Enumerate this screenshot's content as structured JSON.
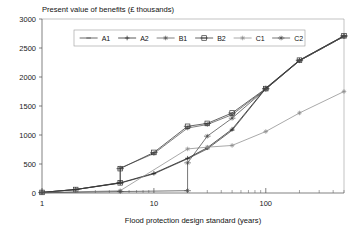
{
  "chart_data": {
    "type": "line",
    "title": "Present value of benefits (£ thousands)",
    "subtitle": "",
    "xlabel": "Flood protection design standard (years)",
    "ylabel": "Present value of benefits (£ thousands)",
    "xscale": "log",
    "xlim": [
      1,
      500
    ],
    "ylim": [
      0,
      3000
    ],
    "xticks": [
      1,
      10,
      100
    ],
    "xtick_labels": [
      "1",
      "10",
      "100"
    ],
    "yticks": [
      0,
      500,
      1000,
      1500,
      2000,
      2500,
      3000
    ],
    "ytick_labels": [
      "0",
      "500",
      "1000",
      "1500",
      "2000",
      "2500",
      "3000"
    ],
    "grid": false,
    "legend_position": "top-center",
    "series": [
      {
        "name": "A1",
        "color": "#3a3a3a",
        "marker": "dash",
        "x": [
          1,
          2,
          5,
          10,
          20,
          30,
          50,
          100,
          200,
          500
        ],
        "y": [
          10,
          60,
          170,
          330,
          590,
          760,
          1080,
          1800,
          2280,
          2700
        ]
      },
      {
        "name": "A2",
        "color": "#222222",
        "marker": "plus",
        "x": [
          1,
          2,
          5,
          10,
          20,
          30,
          50,
          100,
          200,
          500
        ],
        "y": [
          10,
          60,
          175,
          340,
          600,
          780,
          1100,
          1810,
          2290,
          2710
        ]
      },
      {
        "name": "B1",
        "color": "#555555",
        "marker": "asterisk",
        "x": [
          1,
          2,
          5,
          5,
          10,
          20,
          30,
          50,
          100,
          200,
          500
        ],
        "y": [
          10,
          60,
          180,
          430,
          680,
          1120,
          1180,
          1350,
          1790,
          2280,
          2700
        ]
      },
      {
        "name": "B2",
        "color": "#333333",
        "marker": "boxplus",
        "x": [
          1,
          2,
          5,
          5,
          10,
          20,
          30,
          50,
          100,
          200,
          500
        ],
        "y": [
          10,
          60,
          175,
          420,
          700,
          1150,
          1200,
          1380,
          1800,
          2290,
          2710
        ]
      },
      {
        "name": "C1",
        "color": "#8c8c8c",
        "marker": "asterisk",
        "x": [
          1,
          5,
          20,
          30,
          50,
          100,
          200,
          500
        ],
        "y": [
          5,
          40,
          760,
          790,
          820,
          1060,
          1380,
          1750
        ]
      },
      {
        "name": "C2",
        "color": "#4a4a4a",
        "marker": "crossplus",
        "x": [
          1,
          5,
          20,
          20,
          30,
          50,
          100,
          200,
          500
        ],
        "y": [
          5,
          25,
          40,
          520,
          980,
          1290,
          1790,
          2280,
          2700
        ]
      }
    ]
  },
  "legend": {
    "entries": [
      {
        "label": "A1"
      },
      {
        "label": "A2"
      },
      {
        "label": "B1"
      },
      {
        "label": "B2"
      },
      {
        "label": "C1"
      },
      {
        "label": "C2"
      }
    ]
  }
}
